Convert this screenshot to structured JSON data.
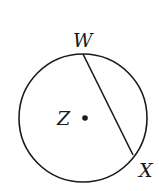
{
  "diagram": {
    "type": "circle-with-chord",
    "circle": {
      "center_label": "Z",
      "cx": 83,
      "cy": 118,
      "r": 64
    },
    "points": [
      {
        "id": "W",
        "label": "W",
        "x": 83,
        "y": 53,
        "label_x": 73,
        "label_y": 46
      },
      {
        "id": "X",
        "label": "X",
        "x": 133,
        "y": 155,
        "label_x": 138,
        "label_y": 176
      },
      {
        "id": "Z",
        "label": "Z",
        "x": 85,
        "y": 118,
        "label_x": 56,
        "label_y": 125
      }
    ],
    "segments": [
      {
        "from": "W",
        "to": "X",
        "kind": "chord"
      }
    ],
    "colors": {
      "stroke": "#1a1a1a",
      "background": "#ffffff"
    }
  }
}
